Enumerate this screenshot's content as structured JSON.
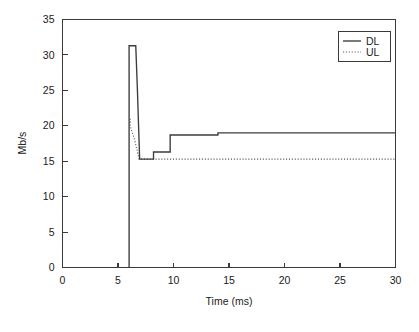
{
  "chart_data": {
    "type": "line",
    "title": "",
    "subtitle": "",
    "xlabel": "Time (ms)",
    "ylabel": "Mb/s",
    "xlim": [
      0,
      30
    ],
    "ylim": [
      0,
      35
    ],
    "xticks": [
      0,
      5,
      10,
      15,
      20,
      25,
      30
    ],
    "yticks": [
      0,
      5,
      10,
      15,
      20,
      25,
      30,
      35
    ],
    "xtick_labels": [
      "0",
      "5",
      "10",
      "15",
      "20",
      "25",
      "30"
    ],
    "ytick_labels": [
      "0",
      "5",
      "10",
      "15",
      "20",
      "25",
      "30",
      "35"
    ],
    "grid": false,
    "legend_position": "top-right",
    "series": [
      {
        "name": "DL",
        "style": "solid",
        "color": "#3c3c3c",
        "points": [
          [
            6.0,
            0.0
          ],
          [
            6.0,
            31.3
          ],
          [
            6.6,
            31.3
          ],
          [
            6.75,
            25.0
          ],
          [
            6.95,
            15.3
          ],
          [
            8.2,
            15.3
          ],
          [
            8.2,
            16.3
          ],
          [
            9.7,
            16.3
          ],
          [
            9.7,
            18.7
          ],
          [
            14.0,
            18.7
          ],
          [
            14.0,
            19.0
          ],
          [
            30.0,
            19.0
          ]
        ]
      },
      {
        "name": "UL",
        "style": "dotted",
        "color": "#555555",
        "points": [
          [
            6.1,
            21.0
          ],
          [
            6.1,
            20.0
          ],
          [
            6.5,
            18.0
          ],
          [
            6.9,
            15.3
          ],
          [
            30.0,
            15.3
          ]
        ]
      }
    ],
    "annotations": []
  },
  "legend": {
    "entries": [
      {
        "label": "DL",
        "style": "solid"
      },
      {
        "label": "UL",
        "style": "dotted"
      }
    ]
  },
  "axes": {
    "x_title": "Time (ms)",
    "y_title": "Mb/s"
  }
}
